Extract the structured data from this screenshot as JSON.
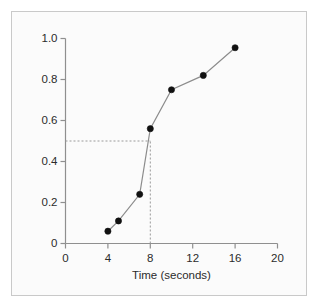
{
  "figure": {
    "background_color": "#fbfbfb",
    "border_color": "#c9c9c9",
    "canvas_color": "#ffffff"
  },
  "chart_data": {
    "type": "line",
    "title": "",
    "subtitle": "",
    "xlabel": "Time (seconds)",
    "ylabel": "",
    "xlim": [
      0,
      20
    ],
    "ylim": [
      0,
      1.0
    ],
    "grid": false,
    "legend": "none",
    "marker": "filled-circle",
    "marker_color": "#111111",
    "line_color": "#8c8c8c",
    "xticks": [
      0,
      4,
      8,
      12,
      16,
      20
    ],
    "xtick_labels": [
      "0",
      "4",
      "8",
      "12",
      "16",
      "20"
    ],
    "yticks": [
      0,
      0.2,
      0.4,
      0.6,
      0.8,
      1.0
    ],
    "ytick_labels": [
      "0",
      "0.2",
      "0.4",
      "0.6",
      "0.8",
      "1.0"
    ],
    "x": [
      4,
      5,
      7,
      8,
      10,
      13,
      16
    ],
    "values": [
      0.06,
      0.11,
      0.24,
      0.56,
      0.75,
      0.82,
      0.955
    ],
    "points": [
      {
        "x": 4,
        "y": 0.06
      },
      {
        "x": 5,
        "y": 0.11
      },
      {
        "x": 7,
        "y": 0.24
      },
      {
        "x": 8,
        "y": 0.56
      },
      {
        "x": 10,
        "y": 0.75
      },
      {
        "x": 13,
        "y": 0.82
      },
      {
        "x": 16,
        "y": 0.955
      }
    ],
    "annotations": [
      {
        "type": "guide-line",
        "style": "dashed",
        "color": "#9a9a9a",
        "orientation": "horizontal",
        "y": 0.5,
        "x_from": 0,
        "x_to": 8
      },
      {
        "type": "guide-line",
        "style": "dashed",
        "color": "#9a9a9a",
        "orientation": "vertical",
        "x": 8,
        "y_from": 0,
        "y_to": 0.5
      }
    ]
  }
}
